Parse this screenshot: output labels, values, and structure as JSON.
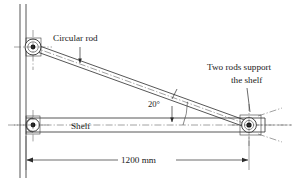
{
  "figure": {
    "background_color": "#ffffff",
    "line_color": "#2b2b2b",
    "text_color": "#1a1a1a"
  },
  "labels": {
    "circular_rod": "Circular rod",
    "two_rods_support": "Two rods support",
    "the_shelf": "the shelf",
    "shelf": "Shelf",
    "angle": "20°",
    "dimension": "1200 mm"
  },
  "geometry": {
    "wall_x_outer": 20,
    "wall_x_inner": 26,
    "wall_top_y": 4,
    "wall_bottom_y": 178,
    "upper_pivot": {
      "x": 33,
      "y": 47
    },
    "lower_pivot": {
      "x": 33,
      "y": 125
    },
    "right_pivot": {
      "x": 249,
      "y": 125
    },
    "shelf_half_thickness": 7,
    "rod_half_thickness": 3.2,
    "angle_degrees": 20,
    "span_label_y": 160
  },
  "components": [
    {
      "name": "wall",
      "type": "vertical-double-line"
    },
    {
      "name": "shelf",
      "type": "horizontal-beam"
    },
    {
      "name": "circular-rod",
      "type": "diagonal-rod"
    },
    {
      "name": "upper-pin-joint",
      "type": "pin"
    },
    {
      "name": "lower-pin-joint",
      "type": "pin"
    },
    {
      "name": "right-pin-joint",
      "type": "pin"
    }
  ],
  "annotations": [
    {
      "name": "circular-rod-leader",
      "target": "circular-rod"
    },
    {
      "name": "two-rods-leader",
      "target": "right-pin-joint"
    },
    {
      "name": "angle-leader",
      "target": "angle-arc"
    },
    {
      "name": "span-dimension",
      "value": "1200 mm"
    }
  ]
}
